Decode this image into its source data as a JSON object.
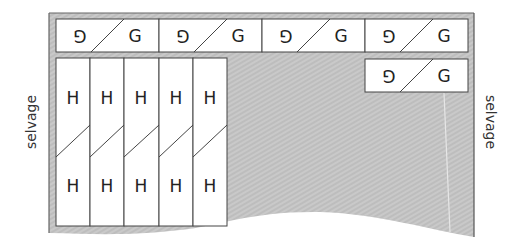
{
  "diagram": {
    "type": "sewing-cutting-layout",
    "colors": {
      "fabric": "#bdbdbd",
      "fabric_stripe": "#d4d4d4",
      "fabric_edge": "#555555",
      "piece_fill": "#ffffff",
      "piece_stroke": "#444444",
      "text": "#222222"
    },
    "labels": {
      "selvage_left": "selvage",
      "selvage_right": "selvage"
    },
    "pieces": {
      "g_top_row": [
        {
          "left": "G",
          "right": "G"
        },
        {
          "left": "G",
          "right": "G"
        },
        {
          "left": "G",
          "right": "G"
        },
        {
          "left": "G",
          "right": "G"
        }
      ],
      "g_second_row": [
        {
          "left": "G",
          "right": "G"
        }
      ],
      "h_columns": [
        {
          "top": "H",
          "bottom": "H"
        },
        {
          "top": "H",
          "bottom": "H"
        },
        {
          "top": "H",
          "bottom": "H"
        },
        {
          "top": "H",
          "bottom": "H"
        },
        {
          "top": "H",
          "bottom": "H"
        }
      ]
    }
  }
}
